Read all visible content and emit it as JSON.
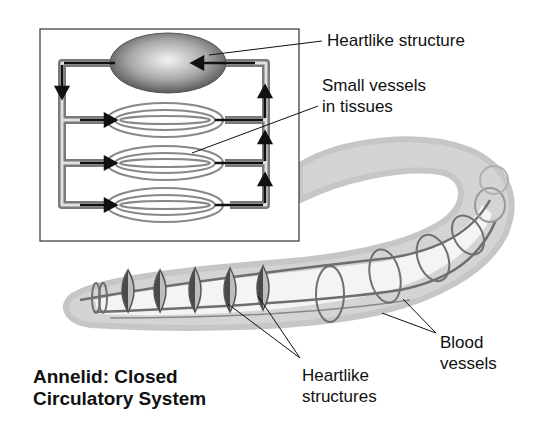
{
  "title": {
    "line1": "Annelid: Closed",
    "line2": "Circulatory System"
  },
  "labels": {
    "heartlike_structure": "Heartlike structure",
    "small_vessels_line1": "Small vessels",
    "small_vessels_line2": "in tissues",
    "blood_vessels_line1": "Blood",
    "blood_vessels_line2": "vessels",
    "heartlike_structures_line1": "Heartlike",
    "heartlike_structures_line2": "structures"
  },
  "colors": {
    "ink": "#111111",
    "body_fill": "#d6d6d6",
    "vessel": "#7a7a7a",
    "heart_dark": "#555555"
  }
}
